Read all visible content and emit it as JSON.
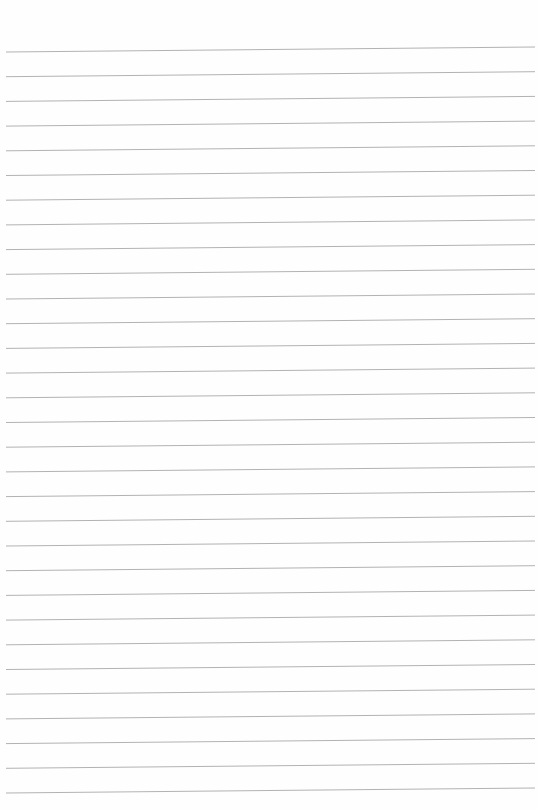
{
  "page": {
    "type": "ruled-paper",
    "background_color": "#fefefe",
    "line_color": "#a9a9a9",
    "line_count": 31,
    "first_line_y_left": 52,
    "line_spacing": 24.7,
    "line_x_start": 6,
    "line_x_end": 535,
    "slope_rise_px": 5,
    "text": ""
  }
}
